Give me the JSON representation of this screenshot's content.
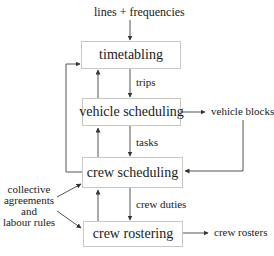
{
  "diagram": {
    "input_top": "lines + frequencies",
    "boxes": {
      "timetabling": "timetabling",
      "vehicle_scheduling": "vehicle scheduling",
      "crew_scheduling": "crew scheduling",
      "crew_rostering": "crew rostering"
    },
    "edge_labels": {
      "trips": "trips",
      "tasks": "tasks",
      "crew_duties": "crew duties"
    },
    "outputs": {
      "vehicle_blocks": "vehicle blocks",
      "crew_rosters": "crew rosters"
    },
    "side_input": {
      "line1": "collective",
      "line2": "agreements",
      "line3": "and",
      "line4": "labour rules"
    },
    "colors": {
      "line": "#555555",
      "box_border": "#c8c8c8"
    }
  }
}
